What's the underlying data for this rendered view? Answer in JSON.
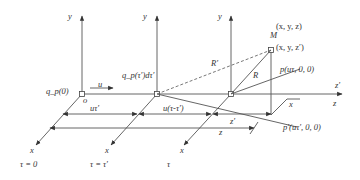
{
  "diagram": {
    "frames": [
      {
        "y_label": "y",
        "x_label": "x",
        "time_label": "τ = 0",
        "charge_label": "q_p(0)",
        "origin_label": "o"
      },
      {
        "y_label": "y",
        "x_label": "x",
        "time_label": "τ = τ′",
        "charge_label": "q_p(τ′)dτ′"
      },
      {
        "y_label": "y",
        "x_label": "x",
        "time_label": "τ"
      }
    ],
    "labels": {
      "velocity": "u",
      "point_M": "M",
      "coord_xyz": "(x, y, z)",
      "coord_xyz_prime": "(x, y, z′)",
      "R_prime": "R′",
      "R": "R",
      "p": "p(uτ, 0, 0)",
      "p_prime": "p′(uτ′, 0, 0)",
      "z_prime_axis": "z′",
      "z_axis": "z",
      "x_small": "x",
      "dist_ut_prime": "uτ′",
      "dist_u_tau_diff": "u(τ-τ′)",
      "dist_z_prime": "z′",
      "dist_z": "z"
    },
    "colors": {
      "line": "#555555",
      "text": "#333333",
      "background": "#ffffff"
    }
  }
}
